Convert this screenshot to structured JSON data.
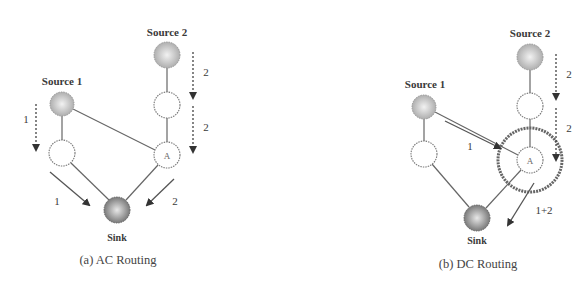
{
  "figure": {
    "panels": [
      {
        "id": "a",
        "caption": "(a) AC Routing",
        "nodes": {
          "source1": {
            "label": "Source 1",
            "x": 62,
            "y": 104,
            "r": 12,
            "type": "source"
          },
          "source2": {
            "label": "Source 2",
            "x": 167,
            "y": 55,
            "r": 13,
            "type": "source"
          },
          "relay_s1": {
            "label": "",
            "x": 62,
            "y": 153,
            "r": 13,
            "type": "relay"
          },
          "relay_s2": {
            "label": "",
            "x": 167,
            "y": 105,
            "r": 13,
            "type": "relay"
          },
          "nodeA": {
            "label": "A",
            "x": 167,
            "y": 155,
            "r": 13,
            "type": "relay"
          },
          "sink": {
            "label": "Sink",
            "x": 117,
            "y": 210,
            "r": 13,
            "type": "sink"
          }
        },
        "flow_labels": {
          "s1_down": "1",
          "s2_down_upper": "2",
          "s2_down_lower": "2",
          "to_sink_left": "1",
          "to_sink_right": "2"
        }
      },
      {
        "id": "b",
        "caption": "(b) DC Routing",
        "nodes": {
          "source1": {
            "label": "Source 1",
            "x": 424,
            "y": 107,
            "r": 12,
            "type": "source"
          },
          "source2": {
            "label": "Source 2",
            "x": 530,
            "y": 57,
            "r": 13,
            "type": "source"
          },
          "relay_s1": {
            "label": "",
            "x": 424,
            "y": 154,
            "r": 13,
            "type": "relay"
          },
          "relay_s2": {
            "label": "",
            "x": 530,
            "y": 106,
            "r": 13,
            "type": "relay"
          },
          "nodeA": {
            "label": "A",
            "x": 530,
            "y": 160,
            "r": 13,
            "type": "relay"
          },
          "sink": {
            "label": "Sink",
            "x": 477,
            "y": 218,
            "r": 13,
            "type": "sink"
          }
        },
        "flow_labels": {
          "s1_to_A": "1",
          "s2_down_upper": "2",
          "s2_down_lower": "2",
          "A_out": "1+2"
        }
      }
    ],
    "colors": {
      "line": "#5a5a5a",
      "dashed": "#4a4a4a",
      "source_fill": "#bdbdbd",
      "sink_fill": "#8e8e8e",
      "relay_fill": "#ffffff",
      "text": "#3a3a3a"
    }
  }
}
